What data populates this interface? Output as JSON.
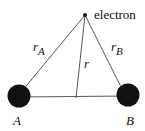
{
  "diagram": {
    "electron": {
      "label": "electron",
      "x": 85,
      "y": 15
    },
    "nucleus_a": {
      "label": "A",
      "x": 19,
      "y": 96,
      "r": 12
    },
    "nucleus_b": {
      "label": "B",
      "x": 128,
      "y": 95,
      "r": 12
    },
    "foot": {
      "x": 76,
      "y": 97
    },
    "distances": {
      "ra": "r",
      "ra_sub": "A",
      "r": "r",
      "rb": "r",
      "rb_sub": "B"
    },
    "colors": {
      "line": "#333333",
      "nucleus": "#111111"
    }
  }
}
